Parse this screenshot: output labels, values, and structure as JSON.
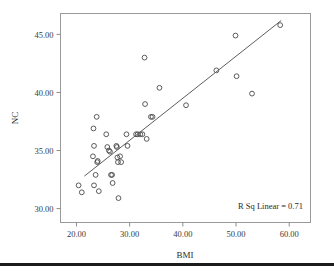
{
  "chart_data": {
    "type": "scatter",
    "title": "",
    "xlabel": "BMI",
    "ylabel": "NC",
    "xlim": [
      17.0,
      64.0
    ],
    "ylim": [
      28.8,
      46.8
    ],
    "grid": false,
    "xticks": [
      20,
      30,
      40,
      50,
      60
    ],
    "xtick_labels": [
      "20.00",
      "30.00",
      "40.00",
      "50.00",
      "60.00"
    ],
    "yticks": [
      30,
      35,
      40,
      45
    ],
    "ytick_labels": [
      "30.00",
      "35.00",
      "40.00",
      "45.00"
    ],
    "annotation": "R Sq Linear = 0.71",
    "r_squared": 0.71,
    "marker": "open-circle",
    "fit_line": {
      "type": "linear",
      "x_start": 21.5,
      "y_start": 32.8,
      "x_end": 58.5,
      "y_end": 46.2
    },
    "points": [
      [
        20.4,
        32.0
      ],
      [
        21.0,
        31.4
      ],
      [
        23.1,
        34.5
      ],
      [
        23.2,
        36.9
      ],
      [
        23.3,
        35.4
      ],
      [
        23.3,
        32.0
      ],
      [
        23.6,
        32.9
      ],
      [
        23.8,
        37.9
      ],
      [
        23.9,
        34.0
      ],
      [
        24.0,
        34.1
      ],
      [
        24.2,
        31.5
      ],
      [
        25.6,
        36.4
      ],
      [
        25.8,
        35.3
      ],
      [
        26.1,
        35.0
      ],
      [
        26.3,
        34.9
      ],
      [
        26.5,
        32.9
      ],
      [
        26.7,
        32.9
      ],
      [
        26.8,
        32.2
      ],
      [
        27.5,
        35.4
      ],
      [
        27.6,
        35.3
      ],
      [
        27.7,
        34.4
      ],
      [
        27.8,
        34.0
      ],
      [
        27.9,
        30.9
      ],
      [
        28.2,
        34.5
      ],
      [
        28.4,
        34.0
      ],
      [
        29.4,
        36.4
      ],
      [
        29.6,
        35.4
      ],
      [
        31.2,
        36.4
      ],
      [
        31.5,
        36.4
      ],
      [
        32.0,
        36.4
      ],
      [
        32.4,
        36.4
      ],
      [
        32.8,
        43.0
      ],
      [
        32.9,
        39.0
      ],
      [
        33.2,
        36.0
      ],
      [
        34.0,
        37.9
      ],
      [
        34.3,
        37.9
      ],
      [
        35.6,
        40.4
      ],
      [
        40.6,
        38.9
      ],
      [
        46.3,
        41.9
      ],
      [
        49.9,
        44.9
      ],
      [
        50.1,
        41.4
      ],
      [
        53.0,
        39.9
      ],
      [
        58.3,
        45.8
      ]
    ]
  },
  "figure": {
    "name": "scatterplot-bmi-nc"
  }
}
